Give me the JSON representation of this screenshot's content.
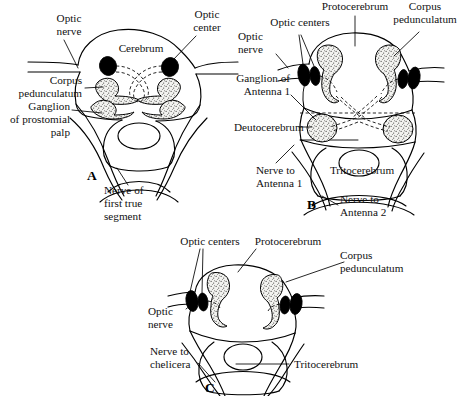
{
  "figure": {
    "background_color": "#ffffff",
    "ink_color": "#000000",
    "stipple_fill_color": "#e8e8e4"
  },
  "panels": [
    {
      "id": "A",
      "letter": "A",
      "labels": {
        "optic_nerve": "Optic\nnerve",
        "optic_nerve_line1": "Optic",
        "optic_nerve_line2": "nerve",
        "cerebrum": "Cerebrum",
        "optic_center_line1": "Optic",
        "optic_center_line2": "center",
        "corpus_line1": "Corpus",
        "corpus_line2": "pedunculatum",
        "ganglion_line1": "Ganglion",
        "ganglion_line2": "of prostomial",
        "ganglion_line3": "palp",
        "nerve_first_line1": "Nerve of",
        "nerve_first_line2": "first true",
        "nerve_first_line3": "segment"
      }
    },
    {
      "id": "B",
      "letter": "B",
      "labels": {
        "protocerebrum": "Protocerebrum",
        "corpus_line1": "Corpus",
        "corpus_line2": "pedunculatum",
        "optic_centers": "Optic centers",
        "optic_nerve_line1": "Optic",
        "optic_nerve_line2": "nerve",
        "ganglion_line1": "Ganglion of",
        "ganglion_line2": "Antenna 1",
        "deutocerebrum": "Deutocerebrum",
        "nerve_ant1_line1": "Nerve to",
        "nerve_ant1_line2": "Antenna 1",
        "tritocerebrum": "Tritocerebrum",
        "nerve_ant2_line1": "Nerve to",
        "nerve_ant2_line2": "Antenna 2"
      }
    },
    {
      "id": "C",
      "letter": "C",
      "labels": {
        "optic_centers": "Optic centers",
        "protocerebrum": "Protocerebrum",
        "corpus_line1": "Corpus",
        "corpus_line2": "pedunculatum",
        "optic_nerve_line1": "Optic",
        "optic_nerve_line2": "nerve",
        "nerve_chelicera_line1": "Nerve to",
        "nerve_chelicera_line2": "chelicera",
        "tritocerebrum": "Tritocerebrum"
      }
    }
  ]
}
